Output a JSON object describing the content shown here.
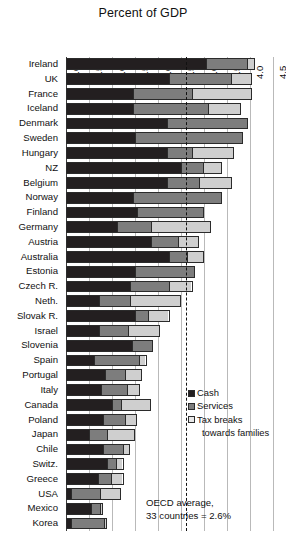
{
  "chart_data": {
    "type": "bar",
    "subtype": "stacked-horizontal",
    "title": "Percent of GDP",
    "xlabel": "",
    "ylabel": "",
    "xlim": [
      0.0,
      4.5
    ],
    "xticks": [
      "0.0",
      "0.5",
      "1.0",
      "1.5",
      "2.0",
      "2.5",
      "3.0",
      "3.5",
      "4.0",
      "4.5"
    ],
    "grid": true,
    "legend_position": "right-middle",
    "categories": [
      "Ireland",
      "UK",
      "France",
      "Iceland",
      "Denmark",
      "Sweden",
      "Hungary",
      "NZ",
      "Belgium",
      "Norway",
      "Finland",
      "Germany",
      "Austria",
      "Australia",
      "Estonia",
      "Czech R.",
      "Neth.",
      "Slovak R.",
      "Israel",
      "Slovenia",
      "Spain",
      "Portugal",
      "Italy",
      "Canada",
      "Poland",
      "Japan",
      "Chile",
      "Switz.",
      "Greece",
      "USA",
      "Mexico",
      "Korea"
    ],
    "series": [
      {
        "name": "Cash",
        "color": "#231f20",
        "values": [
          3.05,
          2.25,
          1.45,
          1.45,
          2.2,
          1.5,
          2.2,
          2.5,
          2.2,
          1.45,
          1.55,
          1.1,
          1.85,
          2.25,
          1.5,
          1.4,
          0.7,
          1.5,
          0.7,
          1.45,
          0.6,
          0.85,
          0.75,
          1.0,
          0.8,
          0.5,
          0.8,
          0.9,
          0.7,
          0.1,
          0.55,
          0.1
        ]
      },
      {
        "name": "Services",
        "color": "#7d7d7d",
        "values": [
          0.9,
          1.35,
          1.3,
          1.65,
          1.75,
          2.35,
          0.55,
          0.5,
          0.7,
          1.95,
          1.45,
          0.75,
          0.6,
          0.4,
          1.3,
          0.85,
          0.7,
          0.3,
          0.65,
          0.45,
          1.0,
          0.45,
          0.6,
          0.2,
          0.5,
          0.4,
          0.45,
          0.2,
          0.3,
          0.65,
          0.2,
          0.75
        ]
      },
      {
        "name": "Tax breaks towards families",
        "color": "#cfcfcf",
        "values": [
          0.15,
          0.45,
          1.3,
          0.7,
          0.0,
          0.0,
          0.9,
          0.4,
          0.7,
          0.0,
          0.0,
          1.3,
          0.45,
          0.35,
          0.0,
          0.5,
          1.1,
          0.45,
          0.7,
          0.0,
          0.15,
          0.35,
          0.25,
          0.65,
          0.25,
          0.6,
          0.15,
          0.15,
          0.25,
          0.45,
          0.05,
          0.05
        ]
      }
    ],
    "annotations": [
      {
        "name": "oecd-average-line",
        "type": "vline",
        "value": 2.6,
        "style": "dashed",
        "label_lines": [
          "OECD average,",
          "33 countries = 2.6%"
        ]
      }
    ]
  },
  "legend": {
    "items": [
      {
        "label": "Cash",
        "color": "#231f20"
      },
      {
        "label": "Services",
        "color": "#7d7d7d"
      },
      {
        "label": "Tax breaks",
        "color": "#e8e8e8"
      }
    ],
    "continuation": "towards families"
  },
  "average_note": {
    "line1": "OECD average,",
    "line2": "33 countries = 2.6%"
  }
}
